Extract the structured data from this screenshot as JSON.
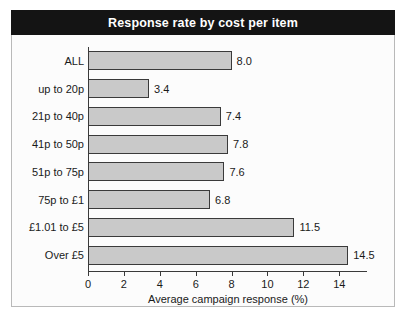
{
  "chart_data": {
    "type": "bar",
    "orientation": "horizontal",
    "title": "Response rate by cost per item",
    "xlabel": "Average campaign response (%)",
    "ylabel": "",
    "categories": [
      "ALL",
      "up to 20p",
      "21p to 40p",
      "41p to 50p",
      "51p to 75p",
      "75p to £1",
      "£1.01 to £5",
      "Over £5"
    ],
    "values": [
      8.0,
      3.4,
      7.4,
      7.8,
      7.6,
      6.8,
      11.5,
      14.5
    ],
    "value_labels": [
      "8.0",
      "3.4",
      "7.4",
      "7.8",
      "7.6",
      "6.8",
      "11.5",
      "14.5"
    ],
    "xticks": [
      0,
      2,
      4,
      6,
      8,
      10,
      12,
      14
    ],
    "xtick_labels": [
      "0",
      "2",
      "4",
      "6",
      "8",
      "10",
      "12",
      "14"
    ],
    "xlim": [
      0,
      15.6
    ],
    "grid": false,
    "legend": null,
    "bar_color": "#c9c9c9",
    "bar_edge_color": "#3a3a3a",
    "title_bar_color": "#141414",
    "title_text_color": "#ffffff",
    "plot_background": "#fcfcfc"
  }
}
